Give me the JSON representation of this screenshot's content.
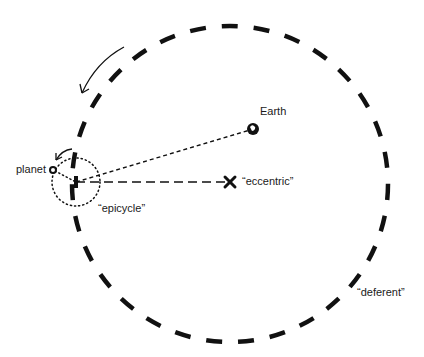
{
  "diagram": {
    "title": "",
    "labels": {
      "earth": "Earth",
      "planet": "planet",
      "epicycle": "“epicycle”",
      "eccentric": "“eccentric”",
      "deferent": "“deferent”"
    },
    "elements": {
      "deferent": {
        "type": "circle",
        "style": "dashed-thick",
        "center": [
          230,
          184
        ],
        "radius": 158
      },
      "epicycle": {
        "type": "circle",
        "style": "dotted",
        "center": [
          76,
          182
        ],
        "radius": 24
      },
      "earth": {
        "type": "point",
        "position": [
          253,
          128
        ]
      },
      "eccentric": {
        "type": "x-mark",
        "position": [
          230,
          182
        ]
      },
      "planet": {
        "type": "point",
        "position": [
          53,
          170
        ]
      },
      "earth_to_epicycle_line": {
        "style": "short-dashed"
      },
      "eccentric_to_epicycle_line": {
        "style": "long-dashed"
      },
      "deferent_motion_arrow": {
        "direction": "counterclockwise"
      },
      "epicycle_motion_arrow": {
        "direction": "counterclockwise"
      }
    },
    "colors": {
      "ink": "#111111",
      "background": "#ffffff"
    }
  }
}
